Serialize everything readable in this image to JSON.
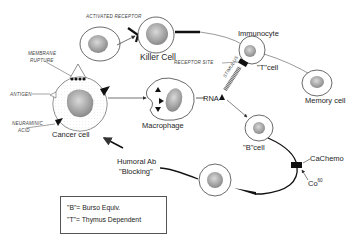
{
  "diagram": {
    "cells": {
      "killer_cell": "Killer Cell",
      "immunocyte": "Immunocyte",
      "t_cell": "\"T\"cell",
      "memory_cell": "Memory cell",
      "macrophage": "Macrophage",
      "cancer_cell": "Cancer cell",
      "b_cell": "\"B\"cell"
    },
    "annotations": {
      "activated_receptor": "Activated Receptor",
      "membrane_rupture_1": "Membrane",
      "membrane_rupture_2": "Rupture",
      "receptor_site": "Receptor Site",
      "antigen": "Antigen",
      "neuraminic_1": "Neuraminic",
      "neuraminic_2": "Acid",
      "stimulus": "Stimulus",
      "rna": "RNA",
      "humoral_1": "Humoral Ab",
      "humoral_2": "\"Blocking\"",
      "ca_chemo": "CaChemo",
      "co60": "Co",
      "co60_sup": "60"
    },
    "legend": {
      "line1": "\"B\"= Burso Equiv.",
      "line2": "\"T\"= Thymus Dependent"
    }
  }
}
